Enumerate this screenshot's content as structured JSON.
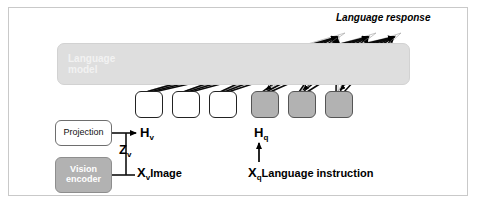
{
  "figure": {
    "frame_color": "#c9c9c9",
    "background": "#ffffff"
  },
  "blocks": {
    "language_model": {
      "label": "Language\nmodel",
      "fill": "#dedede",
      "text_color": "#f2f2f2"
    },
    "projection": {
      "label": "Projection",
      "fill": "#ffffff",
      "text_color": "#111111"
    },
    "vision_encoder": {
      "label": "Vision\nencoder",
      "fill": "#b2b2b2",
      "text_color": "#ffffff"
    }
  },
  "tokens": [
    {
      "name": "token-1",
      "fill": "light"
    },
    {
      "name": "token-2",
      "fill": "light"
    },
    {
      "name": "token-3",
      "fill": "light"
    },
    {
      "name": "token-4",
      "fill": "dark"
    },
    {
      "name": "token-5",
      "fill": "dark"
    },
    {
      "name": "token-6",
      "fill": "dark"
    }
  ],
  "labels": {
    "h_v": "H",
    "h_v_sub": "v",
    "z_v": "Z",
    "z_v_sub": "v",
    "x_v": "X",
    "x_v_sub": "v",
    "x_v_text": "Image",
    "h_q": "H",
    "h_q_sub": "q",
    "x_q": "X",
    "x_q_sub": "q",
    "x_q_text": "Language instruction",
    "language_response": "Language response"
  },
  "colors": {
    "dark_token": "#b2b2b2",
    "light_token": "#ffffff",
    "stroke": "#000000",
    "lm_fill": "#dedede",
    "vision_fill": "#b2b2b2",
    "frame": "#c9c9c9"
  }
}
